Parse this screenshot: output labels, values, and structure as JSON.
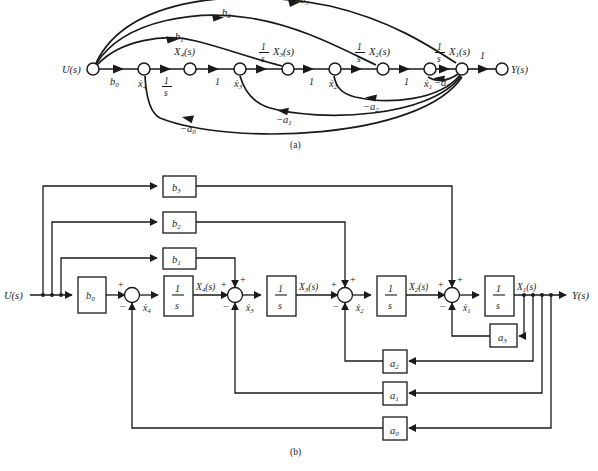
{
  "figure": {
    "panels": [
      {
        "id": "a",
        "caption": "(a)",
        "type": "signal-flow-graph"
      },
      {
        "id": "b",
        "caption": "(b)",
        "type": "block-diagram"
      }
    ]
  },
  "panel_a": {
    "caption": "(a)",
    "input_label": "U(s)",
    "output_label": "Y(s)",
    "nodes": [
      {
        "name": "input-node",
        "label": "U(s)",
        "x": 93,
        "y": 69
      },
      {
        "name": "node-x4dot",
        "label": "ẋ4",
        "under": "ẋ4",
        "x": 144,
        "y": 69
      },
      {
        "name": "node-X4",
        "label": "X4(s)",
        "above": "X₄(s)",
        "x": 190,
        "y": 69
      },
      {
        "name": "node-x3dot",
        "label": "ẋ3",
        "under": "ẋ3",
        "x": 240,
        "y": 69
      },
      {
        "name": "node-X3",
        "label": "X3(s)",
        "above": "X₃(s)",
        "x": 288,
        "y": 69
      },
      {
        "name": "node-x2dot",
        "label": "ẋ2",
        "under": "ẋ2",
        "x": 335,
        "y": 69
      },
      {
        "name": "node-X2",
        "label": "X2(s)",
        "above": "X₂(s)",
        "x": 383,
        "y": 69
      },
      {
        "name": "node-x1dot",
        "label": "ẋ1",
        "under": "ẋ1",
        "x": 430,
        "y": 69
      },
      {
        "name": "node-X1",
        "label": "X1(s)",
        "above": "X₁(s)",
        "x": 462,
        "y": 69
      },
      {
        "name": "output-node",
        "label": "Y(s)",
        "x": 502,
        "y": 69
      }
    ],
    "forward_branch_labels": [
      "b0",
      "1/s",
      "1",
      "1/s",
      "1",
      "1/s",
      "1",
      "1/s",
      "1"
    ],
    "feedforward_gains": [
      {
        "name": "branch-b1",
        "label": "b",
        "sub": "1"
      },
      {
        "name": "branch-b2",
        "label": "b",
        "sub": "2"
      },
      {
        "name": "branch-b3",
        "label": "b",
        "sub": "3"
      }
    ],
    "feedback_gains": [
      {
        "name": "branch-minus-a3",
        "label": "−a",
        "sub": "3"
      },
      {
        "name": "branch-minus-a2",
        "label": "−a",
        "sub": "2"
      },
      {
        "name": "branch-minus-a1",
        "label": "−a",
        "sub": "1"
      },
      {
        "name": "branch-minus-a0",
        "label": "−a",
        "sub": "0"
      }
    ],
    "integrator_label_numerator": "1",
    "integrator_label_denominator": "s",
    "unity_label": "1",
    "b0_label": "b",
    "b0_sub": "0"
  },
  "panel_b": {
    "caption": "(b)",
    "input_label": "U(s)",
    "output_label": "Y(s)",
    "gain_blocks": [
      {
        "name": "block-b3",
        "label": "b",
        "sub": "3",
        "x": 163,
        "y": 176,
        "w": 33,
        "h": 21
      },
      {
        "name": "block-b2",
        "label": "b",
        "sub": "2",
        "x": 163,
        "y": 212,
        "w": 33,
        "h": 21
      },
      {
        "name": "block-b1",
        "label": "b",
        "sub": "1",
        "x": 163,
        "y": 248,
        "w": 33,
        "h": 21
      },
      {
        "name": "block-b0",
        "label": "b",
        "sub": "0",
        "x": 78,
        "y": 277,
        "w": 28,
        "h": 36
      },
      {
        "name": "block-a3",
        "label": "a",
        "sub": "3",
        "x": 490,
        "y": 324,
        "w": 27,
        "h": 23
      },
      {
        "name": "block-a2",
        "label": "a",
        "sub": "2",
        "x": 383,
        "y": 350,
        "w": 24,
        "h": 23
      },
      {
        "name": "block-a1",
        "label": "a",
        "sub": "1",
        "x": 383,
        "y": 382,
        "w": 24,
        "h": 23
      },
      {
        "name": "block-a0",
        "label": "a",
        "sub": "0",
        "x": 383,
        "y": 417,
        "w": 24,
        "h": 23
      }
    ],
    "integrator_blocks": [
      {
        "name": "integrator-1",
        "num": "1",
        "den": "s",
        "x": 164,
        "y": 276,
        "w": 29,
        "h": 40,
        "output": "X₄(s)",
        "state": "ẋ4"
      },
      {
        "name": "integrator-2",
        "num": "1",
        "den": "s",
        "x": 267,
        "y": 276,
        "w": 29,
        "h": 40,
        "output": "X₃(s)",
        "state": "ẋ3"
      },
      {
        "name": "integrator-3",
        "num": "1",
        "den": "s",
        "x": 377,
        "y": 276,
        "w": 29,
        "h": 40,
        "output": "X₂(s)",
        "state": "ẋ2"
      },
      {
        "name": "integrator-4",
        "num": "1",
        "den": "s",
        "x": 485,
        "y": 276,
        "w": 29,
        "h": 40,
        "output": "X₁(s)",
        "state": "ẋ1"
      }
    ],
    "summing_junctions": [
      {
        "name": "summing-junction-1",
        "cx": 132,
        "cy": 295,
        "plus": "+",
        "minus": "−",
        "state": "ẋ4"
      },
      {
        "name": "summing-junction-2",
        "cx": 235,
        "cy": 295,
        "plus": "+",
        "minus": "−",
        "state": "ẋ3"
      },
      {
        "name": "summing-junction-3",
        "cx": 345,
        "cy": 295,
        "plus": "+",
        "minus": "−",
        "state": "ẋ2"
      },
      {
        "name": "summing-junction-4",
        "cx": 452,
        "cy": 295,
        "plus": "+",
        "minus": "−",
        "state": "ẋ1"
      }
    ],
    "state_labels": [
      "ẋ4",
      "ẋ3",
      "ẋ2",
      "ẋ1"
    ],
    "output_state_labels": [
      "X₄(s)",
      "X₃(s)",
      "X₂(s)",
      "X₁(s)"
    ],
    "signs": {
      "plus": "+",
      "minus": "−"
    }
  }
}
